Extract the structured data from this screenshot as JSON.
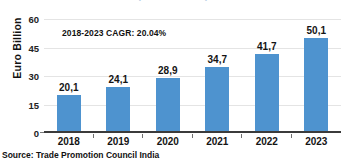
{
  "chart_data": {
    "type": "bar",
    "title": "",
    "xlabel": "",
    "ylabel": "Euro Billion",
    "categories": [
      "2018",
      "2019",
      "2020",
      "2021",
      "2022",
      "2023"
    ],
    "values": [
      20.1,
      24.1,
      28.9,
      34.7,
      41.7,
      50.1
    ],
    "value_labels": [
      "20,1",
      "24,1",
      "28,9",
      "34,7",
      "41,7",
      "50,1"
    ],
    "ylim": [
      0,
      60
    ],
    "yticks": [
      0,
      15,
      30,
      45,
      60
    ],
    "ytick_labels": [
      "0",
      "15",
      "30",
      "45",
      "60"
    ],
    "grid": true,
    "legend": false,
    "series": [
      {
        "name": "Euro Billion",
        "values": [
          20.1,
          24.1,
          28.9,
          34.7,
          41.7,
          50.1
        ],
        "color": "#4e93cf"
      }
    ],
    "annotations": [
      {
        "name": "cagr-note",
        "text": "2018-2023 CAGR: 20.04%"
      }
    ]
  },
  "notes": {
    "source": "Source: Trade Promotion Council India",
    "cagr": "2018-2023 CAGR: 20.04%"
  },
  "title_fragment": "(in Euro Billion)",
  "colors": {
    "bar": "#4e93cf",
    "grid": "#e4e4e4",
    "axis": "#3b3b3b",
    "text": "#141414"
  }
}
